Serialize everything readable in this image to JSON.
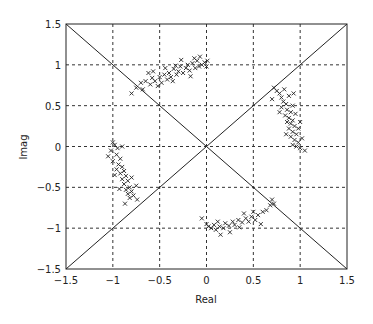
{
  "chart_data": {
    "type": "scatter",
    "title": "",
    "xlabel": "Real",
    "ylabel": "Imag",
    "xlim": [
      -1.5,
      1.5
    ],
    "ylim": [
      -1.5,
      1.5
    ],
    "xticks": [
      "-1.5",
      "-1",
      "-0.5",
      "0",
      "0.5",
      "1",
      "1.5"
    ],
    "yticks": [
      "1.5",
      "1",
      "0.5",
      "0",
      "-0.5",
      "-1",
      "-1.5"
    ],
    "grid": true,
    "grid_style": "dashed",
    "marker": "x",
    "reference_lines": [
      {
        "from": [
          -1.5,
          1.5
        ],
        "to": [
          1.5,
          -1.5
        ]
      },
      {
        "from": [
          -1.5,
          -1.5
        ],
        "to": [
          1.5,
          1.5
        ]
      }
    ],
    "series": [
      {
        "name": "cluster-top",
        "center": [
          -0.35,
          0.9
        ],
        "points": [
          [
            -0.75,
            0.72
          ],
          [
            -0.7,
            0.78
          ],
          [
            -0.65,
            0.8
          ],
          [
            -0.6,
            0.76
          ],
          [
            -0.58,
            0.84
          ],
          [
            -0.55,
            0.8
          ],
          [
            -0.5,
            0.85
          ],
          [
            -0.48,
            0.78
          ],
          [
            -0.45,
            0.88
          ],
          [
            -0.42,
            0.82
          ],
          [
            -0.4,
            0.9
          ],
          [
            -0.38,
            0.85
          ],
          [
            -0.35,
            0.95
          ],
          [
            -0.32,
            0.88
          ],
          [
            -0.3,
            0.92
          ],
          [
            -0.28,
            0.98
          ],
          [
            -0.25,
            0.9
          ],
          [
            -0.22,
            0.96
          ],
          [
            -0.2,
            1.0
          ],
          [
            -0.18,
            0.93
          ],
          [
            -0.15,
            1.02
          ],
          [
            -0.12,
            0.96
          ],
          [
            -0.1,
            1.05
          ],
          [
            -0.08,
            0.98
          ],
          [
            -0.05,
            1.0
          ],
          [
            -0.02,
            1.03
          ],
          [
            0.0,
            0.98
          ],
          [
            0.01,
            1.05
          ],
          [
            -0.62,
            0.9
          ],
          [
            -0.52,
            0.74
          ],
          [
            -0.44,
            0.96
          ],
          [
            -0.36,
            0.8
          ],
          [
            -0.27,
            1.06
          ],
          [
            -0.17,
            0.86
          ],
          [
            -0.07,
            1.1
          ],
          [
            -0.8,
            0.65
          ],
          [
            -0.68,
            0.7
          ],
          [
            -0.57,
            0.92
          ],
          [
            -0.33,
            0.99
          ],
          [
            -0.13,
            1.08
          ]
        ]
      },
      {
        "name": "cluster-right",
        "center": [
          0.9,
          0.35
        ],
        "points": [
          [
            0.72,
            0.72
          ],
          [
            0.75,
            0.68
          ],
          [
            0.78,
            0.65
          ],
          [
            0.8,
            0.6
          ],
          [
            0.82,
            0.55
          ],
          [
            0.85,
            0.52
          ],
          [
            0.8,
            0.48
          ],
          [
            0.86,
            0.45
          ],
          [
            0.9,
            0.42
          ],
          [
            0.84,
            0.38
          ],
          [
            0.88,
            0.35
          ],
          [
            0.92,
            0.32
          ],
          [
            0.86,
            0.3
          ],
          [
            0.9,
            0.28
          ],
          [
            0.94,
            0.25
          ],
          [
            0.88,
            0.22
          ],
          [
            0.92,
            0.18
          ],
          [
            0.96,
            0.15
          ],
          [
            0.9,
            0.12
          ],
          [
            0.94,
            0.08
          ],
          [
            0.98,
            0.05
          ],
          [
            0.92,
            0.02
          ],
          [
            0.96,
            0.0
          ],
          [
            1.0,
            -0.02
          ],
          [
            0.88,
            0.62
          ],
          [
            0.83,
            0.7
          ],
          [
            0.95,
            0.4
          ],
          [
            0.78,
            0.42
          ],
          [
            1.0,
            0.3
          ],
          [
            0.98,
            0.22
          ],
          [
            0.85,
            0.15
          ],
          [
            1.02,
            0.1
          ],
          [
            0.7,
            0.58
          ],
          [
            0.92,
            0.5
          ],
          [
            1.05,
            -0.05
          ],
          [
            0.93,
            0.65
          ]
        ]
      },
      {
        "name": "cluster-left",
        "center": [
          -0.9,
          -0.3
        ],
        "points": [
          [
            -1.0,
            0.05
          ],
          [
            -0.98,
            0.02
          ],
          [
            -0.95,
            -0.02
          ],
          [
            -1.02,
            -0.05
          ],
          [
            -0.96,
            -0.1
          ],
          [
            -0.92,
            -0.15
          ],
          [
            -1.0,
            -0.18
          ],
          [
            -0.94,
            -0.22
          ],
          [
            -0.9,
            -0.25
          ],
          [
            -0.96,
            -0.28
          ],
          [
            -0.88,
            -0.3
          ],
          [
            -0.92,
            -0.33
          ],
          [
            -0.86,
            -0.36
          ],
          [
            -0.9,
            -0.4
          ],
          [
            -0.84,
            -0.42
          ],
          [
            -0.88,
            -0.46
          ],
          [
            -0.82,
            -0.5
          ],
          [
            -0.86,
            -0.53
          ],
          [
            -0.8,
            -0.55
          ],
          [
            -0.84,
            -0.58
          ],
          [
            -0.78,
            -0.6
          ],
          [
            -0.82,
            -0.63
          ],
          [
            -0.9,
            0.0
          ],
          [
            -1.05,
            -0.12
          ],
          [
            -0.98,
            -0.35
          ],
          [
            -0.75,
            -0.48
          ],
          [
            -0.8,
            -0.38
          ],
          [
            -0.93,
            -0.52
          ],
          [
            -0.74,
            -0.65
          ],
          [
            -0.87,
            -0.7
          ]
        ]
      },
      {
        "name": "cluster-bottom",
        "center": [
          0.35,
          -0.9
        ],
        "points": [
          [
            0.0,
            -0.95
          ],
          [
            0.02,
            -0.98
          ],
          [
            0.05,
            -1.0
          ],
          [
            0.08,
            -0.96
          ],
          [
            0.1,
            -1.02
          ],
          [
            0.14,
            -0.98
          ],
          [
            0.18,
            -1.0
          ],
          [
            0.2,
            -0.94
          ],
          [
            0.24,
            -0.97
          ],
          [
            0.28,
            -0.92
          ],
          [
            0.3,
            -0.96
          ],
          [
            0.34,
            -0.9
          ],
          [
            0.38,
            -0.93
          ],
          [
            0.42,
            -0.88
          ],
          [
            0.45,
            -0.92
          ],
          [
            0.48,
            -0.86
          ],
          [
            0.52,
            -0.9
          ],
          [
            0.55,
            -0.84
          ],
          [
            0.6,
            -0.8
          ],
          [
            0.64,
            -0.78
          ],
          [
            0.68,
            -0.72
          ],
          [
            0.72,
            -0.7
          ],
          [
            0.15,
            -1.08
          ],
          [
            0.25,
            -1.05
          ],
          [
            -0.05,
            -0.88
          ],
          [
            0.4,
            -0.82
          ],
          [
            0.58,
            -0.95
          ],
          [
            0.35,
            -0.99
          ],
          [
            0.7,
            -0.65
          ],
          [
            0.12,
            -0.92
          ],
          [
            0.5,
            -0.8
          ]
        ]
      }
    ]
  }
}
